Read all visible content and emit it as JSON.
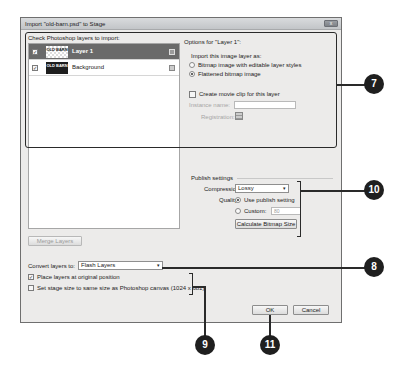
{
  "dialog": {
    "title": "Import \"old-barn.psd\" to Stage",
    "close_label": "x"
  },
  "layers": {
    "label": "Check Photoshop layers to import:",
    "items": [
      {
        "name": "Layer 1",
        "checked": true,
        "selected": true,
        "thumb_text": "OLD BARN"
      },
      {
        "name": "Background",
        "checked": true,
        "selected": false,
        "thumb_text": "OLD BARN"
      }
    ],
    "check_glyph": "✓",
    "merge_button": "Merge Layers"
  },
  "options": {
    "title": "Options for \"Layer 1\":",
    "import_as_label": "Import this image layer as:",
    "radio_bitmap_styles": "Bitmap image with editable layer styles",
    "radio_flattened": "Flattened bitmap image",
    "movie_clip_label": "Create movie clip for this layer",
    "instance_name_label": "Instance name:",
    "instance_name_value": "",
    "registration_label": "Registration:"
  },
  "publish": {
    "title": "Publish settings",
    "compression_label": "Compression:",
    "compression_value": "Lossy",
    "quality_label": "Quality:",
    "use_publish_setting": "Use publish setting",
    "custom_label": "Custom:",
    "custom_value": "80",
    "calc_button": "Calculate Bitmap Size"
  },
  "convert": {
    "label": "Convert layers to:",
    "value": "Flash Layers",
    "place_original": "Place layers at original position",
    "place_original_checked": true,
    "stage_size": "Set stage size to same size as Photoshop canvas (1024 x 681)",
    "stage_size_checked": false
  },
  "buttons": {
    "ok": "OK",
    "cancel": "Cancel"
  },
  "callouts": {
    "c7": "7",
    "c8": "8",
    "c9": "9",
    "c10": "10",
    "c11": "11"
  },
  "dropdown_arrow": "▾"
}
